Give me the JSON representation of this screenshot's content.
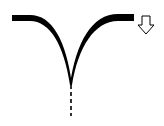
{
  "diagram": {
    "type": "merge-symbol",
    "colors": {
      "stroke": "#000000",
      "background": "#ffffff",
      "arrow_fill": "#ffffff",
      "arrow_stroke": "#000000"
    },
    "elements": {
      "left_branch": "curved-path-left",
      "right_branch": "curved-path-right",
      "merged_line": "dashed-line",
      "direction_indicator": "down-arrow-icon"
    }
  }
}
